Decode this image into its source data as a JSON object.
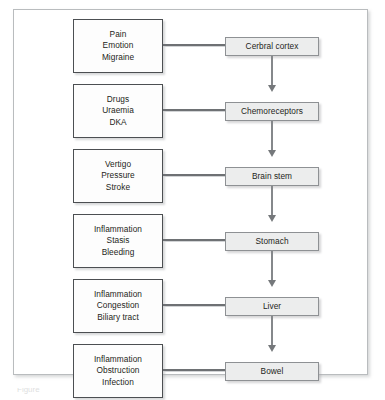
{
  "figure": {
    "caption_partial": "Figure"
  },
  "colors": {
    "frame_border": "#b9bcbe",
    "cause_box_border": "#4c4f52",
    "cause_box_fill": "#fdfdfd",
    "site_box_border": "#8e9194",
    "site_box_fill": "#eceded",
    "connector": "#6e7174",
    "arrow": "#85888b",
    "text": "#1d1f21"
  },
  "rows": [
    {
      "site": "Cerbral cortex",
      "causes": [
        "Pain",
        "Emotion",
        "Migraine"
      ]
    },
    {
      "site": "Chemoreceptors",
      "causes": [
        "Drugs",
        "Uraemia",
        "DKA"
      ]
    },
    {
      "site": "Brain stem",
      "causes": [
        "Vertigo",
        "Pressure",
        "Stroke"
      ]
    },
    {
      "site": "Stomach",
      "causes": [
        "Inflammation",
        "Stasis",
        "Bleeding"
      ]
    },
    {
      "site": "Liver",
      "causes": [
        "Inflammation",
        "Congestion",
        "Biliary tract"
      ]
    },
    {
      "site": "Bowel",
      "causes": [
        "Inflammation",
        "Obstruction",
        "Infection"
      ]
    }
  ]
}
